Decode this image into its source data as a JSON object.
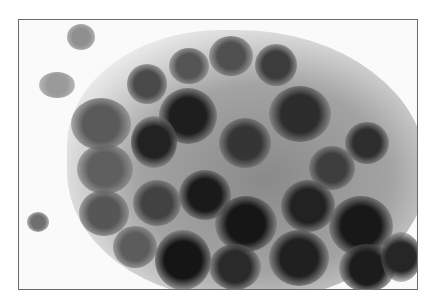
{
  "image": {
    "subject": "grayscale micrograph of a cluster of cells with dark nuclei",
    "frame_color": "#6a6a6a",
    "background_color": "#fafafa"
  },
  "cells": [
    {
      "x": 48,
      "y": 4,
      "w": 28,
      "h": 26,
      "shade": "#8f8f8f"
    },
    {
      "x": 20,
      "y": 52,
      "w": 36,
      "h": 26,
      "shade": "#9a9a9a"
    },
    {
      "x": 8,
      "y": 192,
      "w": 22,
      "h": 20,
      "shade": "#6f6f6f"
    },
    {
      "x": 108,
      "y": 44,
      "w": 40,
      "h": 40,
      "shade": "#4a4a4a"
    },
    {
      "x": 150,
      "y": 28,
      "w": 40,
      "h": 36,
      "shade": "#555555"
    },
    {
      "x": 190,
      "y": 16,
      "w": 44,
      "h": 40,
      "shade": "#505050"
    },
    {
      "x": 236,
      "y": 24,
      "w": 42,
      "h": 42,
      "shade": "#3c3c3c"
    },
    {
      "x": 52,
      "y": 78,
      "w": 60,
      "h": 52,
      "shade": "#5a5a5a"
    },
    {
      "x": 140,
      "y": 68,
      "w": 58,
      "h": 56,
      "shade": "#1e1e1e"
    },
    {
      "x": 112,
      "y": 96,
      "w": 46,
      "h": 52,
      "shade": "#222222"
    },
    {
      "x": 250,
      "y": 66,
      "w": 62,
      "h": 56,
      "shade": "#2c2c2c"
    },
    {
      "x": 326,
      "y": 102,
      "w": 44,
      "h": 42,
      "shade": "#2e2e2e"
    },
    {
      "x": 200,
      "y": 98,
      "w": 52,
      "h": 50,
      "shade": "#353535"
    },
    {
      "x": 58,
      "y": 124,
      "w": 56,
      "h": 50,
      "shade": "#5f5f5f"
    },
    {
      "x": 290,
      "y": 126,
      "w": 46,
      "h": 44,
      "shade": "#3e3e3e"
    },
    {
      "x": 160,
      "y": 150,
      "w": 52,
      "h": 50,
      "shade": "#1a1a1a"
    },
    {
      "x": 114,
      "y": 160,
      "w": 48,
      "h": 46,
      "shade": "#424242"
    },
    {
      "x": 60,
      "y": 170,
      "w": 50,
      "h": 46,
      "shade": "#565656"
    },
    {
      "x": 262,
      "y": 160,
      "w": 54,
      "h": 52,
      "shade": "#222222"
    },
    {
      "x": 196,
      "y": 176,
      "w": 62,
      "h": 56,
      "shade": "#161616"
    },
    {
      "x": 310,
      "y": 176,
      "w": 64,
      "h": 60,
      "shade": "#181818"
    },
    {
      "x": 94,
      "y": 206,
      "w": 44,
      "h": 42,
      "shade": "#5c5c5c"
    },
    {
      "x": 136,
      "y": 210,
      "w": 56,
      "h": 60,
      "shade": "#151515"
    },
    {
      "x": 190,
      "y": 224,
      "w": 52,
      "h": 46,
      "shade": "#2a2a2a"
    },
    {
      "x": 250,
      "y": 210,
      "w": 60,
      "h": 56,
      "shade": "#202020"
    },
    {
      "x": 320,
      "y": 224,
      "w": 56,
      "h": 48,
      "shade": "#1c1c1c"
    },
    {
      "x": 362,
      "y": 212,
      "w": 40,
      "h": 50,
      "shade": "#262626"
    }
  ]
}
